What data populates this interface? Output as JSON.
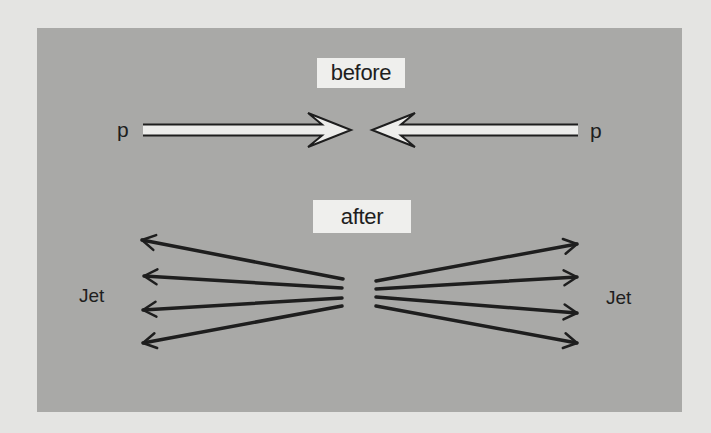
{
  "colors": {
    "background": "#e4e4e2",
    "panel": "#a9a9a7",
    "label_box": "#efefed",
    "ink": "#1e1e1e",
    "beam_fill": "#ededeb"
  },
  "labels": {
    "before": "before",
    "after": "after",
    "proton_left": "p",
    "proton_right": "p",
    "jet_left": "Jet",
    "jet_right": "Jet"
  },
  "before_panel": {
    "beams": [
      {
        "name": "incoming-proton-left",
        "from": [
          143,
          130
        ],
        "to": [
          351,
          130
        ],
        "direction": "right"
      },
      {
        "name": "incoming-proton-right",
        "from": [
          578,
          130
        ],
        "to": [
          372,
          130
        ],
        "direction": "left"
      }
    ]
  },
  "after_panel": {
    "left_jet_arrows": [
      {
        "from": [
          343,
          279
        ],
        "to": [
          142,
          240
        ]
      },
      {
        "from": [
          342,
          288
        ],
        "to": [
          144,
          276
        ]
      },
      {
        "from": [
          342,
          298
        ],
        "to": [
          143,
          310
        ]
      },
      {
        "from": [
          342,
          306
        ],
        "to": [
          143,
          343
        ]
      }
    ],
    "right_jet_arrows": [
      {
        "from": [
          376,
          281
        ],
        "to": [
          577,
          244
        ]
      },
      {
        "from": [
          376,
          289
        ],
        "to": [
          577,
          277
        ]
      },
      {
        "from": [
          376,
          297
        ],
        "to": [
          577,
          313
        ]
      },
      {
        "from": [
          376,
          306
        ],
        "to": [
          577,
          343
        ]
      }
    ]
  }
}
